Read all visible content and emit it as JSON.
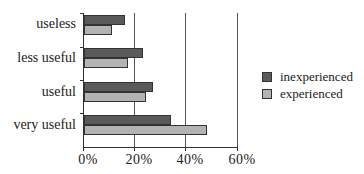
{
  "chart_data": {
    "type": "bar",
    "orientation": "horizontal",
    "title": "",
    "xlabel": "",
    "ylabel": "",
    "categories": [
      "useless",
      "less useful",
      "useful",
      "very useful"
    ],
    "series": [
      {
        "name": "inexperienced",
        "color": "#5a5a5a",
        "values": [
          16,
          23,
          27,
          34
        ]
      },
      {
        "name": "experienced",
        "color": "#b3b3b3",
        "values": [
          11,
          17,
          24,
          48
        ]
      }
    ],
    "xlim": [
      0,
      60
    ],
    "xticks": [
      "0%",
      "20%",
      "40%",
      "60%"
    ],
    "grid": "vertical",
    "legend_position": "right"
  },
  "labels": {
    "cat0": "useless",
    "cat1": "less useful",
    "cat2": "useful",
    "cat3": "very useful",
    "x0": "0%",
    "x1": "20%",
    "x2": "40%",
    "x3": "60%",
    "legend0": "inexperienced",
    "legend1": "experienced"
  }
}
